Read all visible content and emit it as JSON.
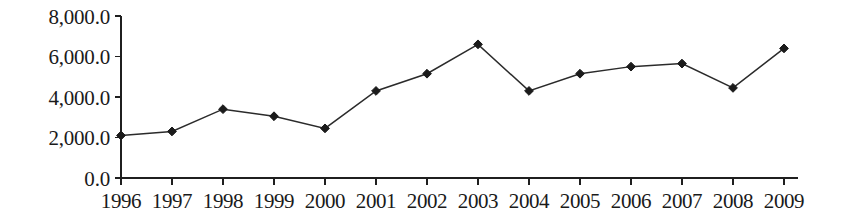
{
  "chart_data": {
    "type": "line",
    "title": "",
    "subtitle": "",
    "xlabel": "",
    "ylabel": "",
    "categories": [
      "1996",
      "1997",
      "1998",
      "1999",
      "2000",
      "2001",
      "2002",
      "2003",
      "2004",
      "2005",
      "2006",
      "2007",
      "2008",
      "2009"
    ],
    "values": [
      2100,
      2300,
      3400,
      3050,
      2450,
      4300,
      5150,
      6600,
      4300,
      5150,
      5500,
      5650,
      4450,
      6400
    ],
    "series": [
      {
        "name": "",
        "values": [
          2100,
          2300,
          3400,
          3050,
          2450,
          4300,
          5150,
          6600,
          4300,
          5150,
          5500,
          5650,
          4450,
          6400
        ]
      }
    ],
    "ylim": [
      0,
      8000
    ],
    "ytick_values": [
      0,
      2000,
      4000,
      6000,
      8000
    ],
    "ytick_labels": [
      "0.0",
      "2,000.0",
      "4,000.0",
      "6,000.0",
      "8,000.0"
    ],
    "xtick_labels": [
      "1996",
      "1997",
      "1998",
      "1999",
      "2000",
      "2001",
      "2002",
      "2003",
      "2004",
      "2005",
      "2006",
      "2007",
      "2008",
      "2009"
    ],
    "grid": false,
    "legend": "none",
    "marker": "diamond",
    "line_color": "#2b2b2b",
    "marker_color": "#1b1b1b",
    "axis_color": "#1f1f1f",
    "background_color": "#ffffff"
  }
}
